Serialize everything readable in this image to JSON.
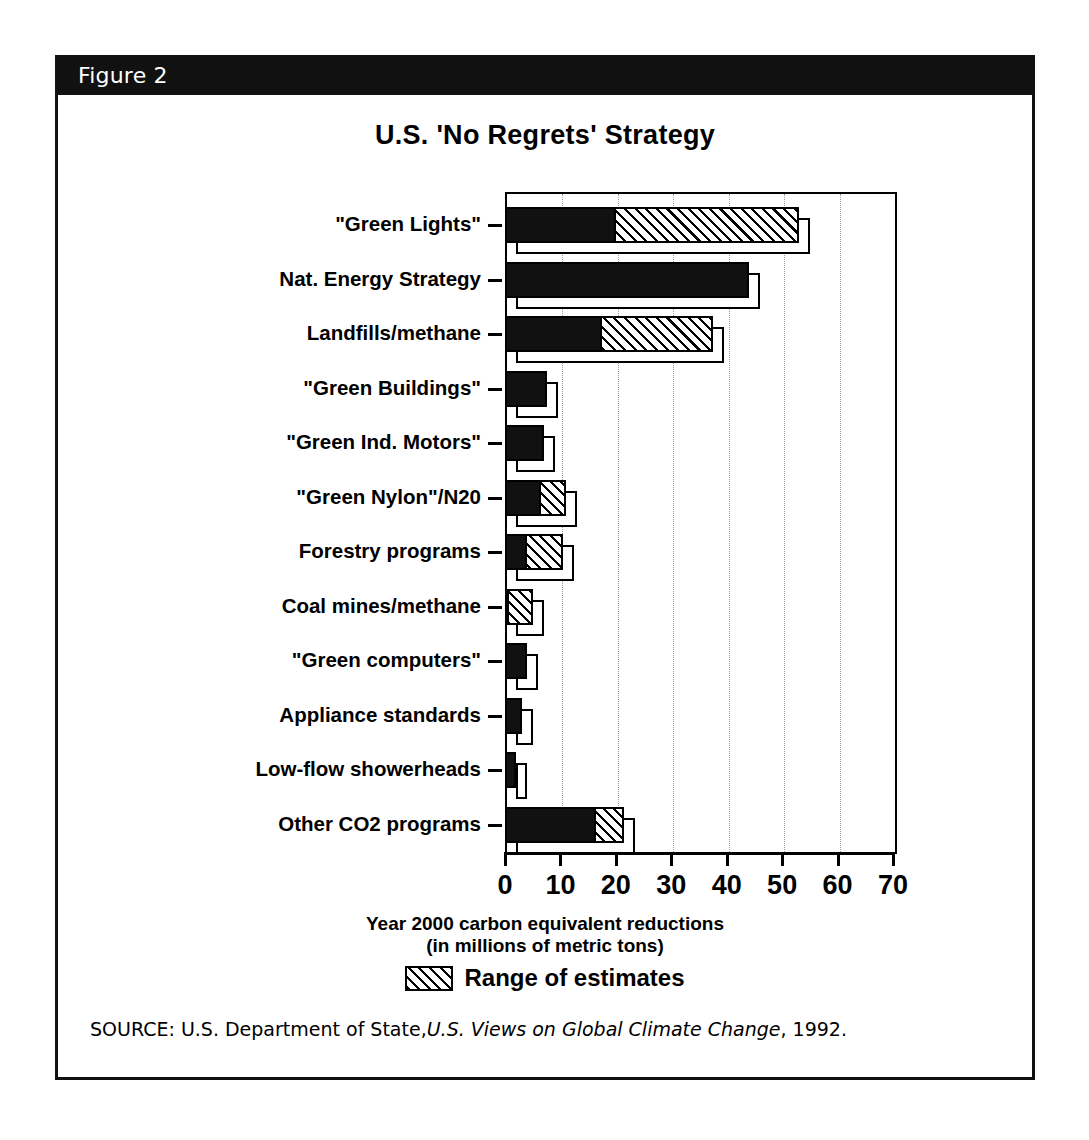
{
  "figure": {
    "header_label": "Figure 2",
    "title": "U.S. 'No Regrets' Strategy"
  },
  "axis_caption": {
    "line1": "Year 2000 carbon equivalent reductions",
    "line2": "(in millions of metric tons)"
  },
  "legend": {
    "swatch_name": "hatched-range-swatch",
    "text": "Range of estimates"
  },
  "source": {
    "label": "SOURCE:",
    "text_before": "U.S. Department of State,",
    "italic": "U.S. Views on Global Climate Change",
    "text_after": ", 1992."
  },
  "colors": {
    "ink": "#000000",
    "paper": "#ffffff",
    "header_bar": "#111111",
    "gridline": "#9a9a9a"
  },
  "chart_data": {
    "type": "bar",
    "orientation": "horizontal",
    "title": "U.S. 'No Regrets' Strategy",
    "xlabel": "Year 2000 carbon equivalent reductions (in millions of metric tons)",
    "ylabel": "",
    "xlim": [
      0,
      70
    ],
    "xticks": [
      0,
      10,
      20,
      30,
      40,
      50,
      60,
      70
    ],
    "xtick_labels": [
      "0",
      "10",
      "20",
      "30",
      "40",
      "50",
      "60",
      "70"
    ],
    "grid": "vertical-dotted",
    "legend_position": "below-axis-center",
    "series": [
      {
        "name": "Low estimate",
        "style": "solid-black"
      },
      {
        "name": "Range of estimates",
        "style": "hatched"
      }
    ],
    "categories": [
      "\"Green Lights\"",
      "Nat. Energy Strategy",
      "Landfills/methane",
      "\"Green Buildings\"",
      "\"Green Ind. Motors\"",
      "\"Green Nylon\"/N20",
      "Forestry programs",
      "Coal mines/methane",
      "\"Green computers\"",
      "Appliance standards",
      "Low-flow showerheads",
      "Other CO2 programs"
    ],
    "low_values": [
      20,
      44,
      17.5,
      7.5,
      7,
      6.5,
      4,
      0.5,
      4,
      3,
      2,
      16.5
    ],
    "high_values": [
      53,
      44,
      37.5,
      7.5,
      7,
      11,
      10.5,
      5,
      4,
      3,
      2,
      21.5
    ],
    "bars": [
      {
        "category": "\"Green Lights\"",
        "low": 20,
        "high": 53
      },
      {
        "category": "Nat. Energy Strategy",
        "low": 44,
        "high": 44
      },
      {
        "category": "Landfills/methane",
        "low": 17.5,
        "high": 37.5
      },
      {
        "category": "\"Green Buildings\"",
        "low": 7.5,
        "high": 7.5
      },
      {
        "category": "\"Green Ind. Motors\"",
        "low": 7,
        "high": 7
      },
      {
        "category": "\"Green Nylon\"/N20",
        "low": 6.5,
        "high": 11
      },
      {
        "category": "Forestry programs",
        "low": 4,
        "high": 10.5
      },
      {
        "category": "Coal mines/methane",
        "low": 0.5,
        "high": 5
      },
      {
        "category": "\"Green computers\"",
        "low": 4,
        "high": 4
      },
      {
        "category": "Appliance standards",
        "low": 3,
        "high": 3
      },
      {
        "category": "Low-flow showerheads",
        "low": 2,
        "high": 2
      },
      {
        "category": "Other CO2 programs",
        "low": 16.5,
        "high": 21.5
      }
    ]
  }
}
